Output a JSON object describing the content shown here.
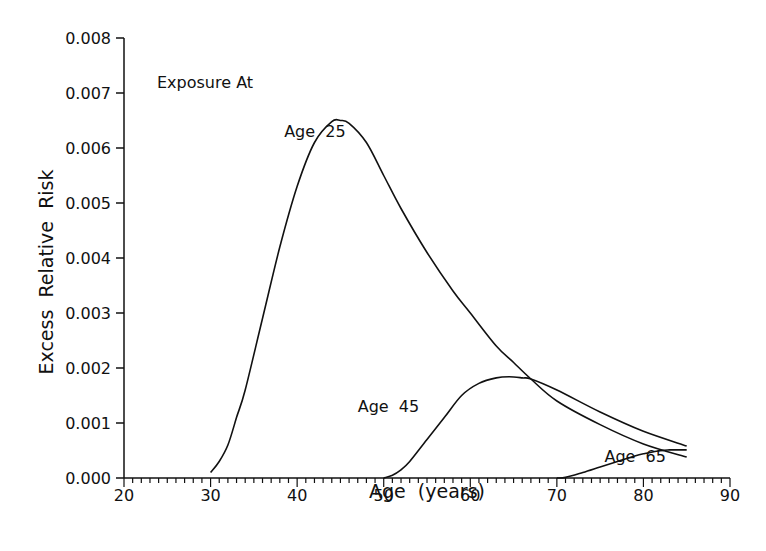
{
  "chart_data": {
    "type": "line",
    "title": "",
    "xlabel": "Age  (years)",
    "ylabel": "Excess  Relative  Risk",
    "xlim": [
      20,
      90
    ],
    "ylim": [
      0.0,
      0.008
    ],
    "x_ticks": [
      20,
      30,
      40,
      50,
      60,
      70,
      80,
      90
    ],
    "x_tick_labels": [
      "20",
      "30",
      "40",
      "50",
      "60",
      "70",
      "80",
      "90"
    ],
    "y_ticks": [
      0.0,
      0.001,
      0.002,
      0.003,
      0.004,
      0.005,
      0.006,
      0.007,
      0.008
    ],
    "y_tick_labels": [
      "0.000",
      "0.001",
      "0.002",
      "0.003",
      "0.004",
      "0.005",
      "0.006",
      "0.007",
      "0.008"
    ],
    "x_minor_tick_step": 1,
    "grid": false,
    "legend_title": "Exposure At",
    "series": [
      {
        "name": "Age  25",
        "x": [
          30,
          31,
          32,
          33,
          34,
          36,
          38,
          40,
          42,
          44,
          45,
          46,
          48,
          50,
          52,
          55,
          58,
          60,
          63,
          65,
          67,
          70,
          75,
          80,
          85
        ],
        "values": [
          0.0001,
          0.0003,
          0.0006,
          0.0011,
          0.0016,
          0.0029,
          0.0042,
          0.0053,
          0.0061,
          0.00648,
          0.0065,
          0.00645,
          0.0061,
          0.0055,
          0.0049,
          0.0041,
          0.0034,
          0.003,
          0.0024,
          0.0021,
          0.0018,
          0.0014,
          0.00097,
          0.00062,
          0.00038
        ],
        "label_position": [
          38.5,
          0.0062
        ]
      },
      {
        "name": "Age  45",
        "x": [
          50,
          51,
          52,
          53,
          55,
          57,
          59,
          61,
          63,
          64.5,
          66,
          67,
          70,
          75,
          80,
          85
        ],
        "values": [
          0.0,
          5e-05,
          0.00015,
          0.0003,
          0.0007,
          0.0011,
          0.0015,
          0.00172,
          0.00182,
          0.00184,
          0.00182,
          0.0018,
          0.0016,
          0.0012,
          0.00085,
          0.00058
        ],
        "label_position": [
          47,
          0.0012
        ]
      },
      {
        "name": "Age  65",
        "x": [
          70,
          71,
          73,
          75,
          77,
          79,
          80,
          82,
          83,
          85
        ],
        "values": [
          0.0,
          1e-05,
          0.0001,
          0.0002,
          0.0003,
          0.0004,
          0.00044,
          0.0005,
          0.00051,
          0.00051
        ],
        "label_position": [
          75.5,
          0.0003
        ]
      }
    ]
  }
}
